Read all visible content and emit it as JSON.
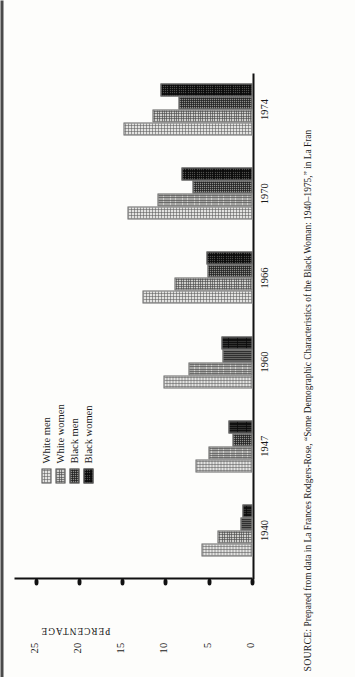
{
  "figure": {
    "orientation": "rotated-90-ccw-scan",
    "y_axis_title": "PERCENTAGE",
    "y_ticks": [
      "0",
      "5",
      "10",
      "15",
      "20",
      "25"
    ],
    "y_max": 27.5
  },
  "legend": {
    "items": [
      {
        "label": "White men",
        "pattern": "p0"
      },
      {
        "label": "White women",
        "pattern": "p1"
      },
      {
        "label": "Black men",
        "pattern": "p2"
      },
      {
        "label": "Black women",
        "pattern": "p3"
      }
    ]
  },
  "chart_data": {
    "type": "bar",
    "title": "",
    "xlabel": "",
    "ylabel": "PERCENTAGE",
    "ylim": [
      0,
      27.5
    ],
    "grid": false,
    "legend_position": "upper-left-inside",
    "categories": [
      "1940",
      "1947",
      "1960",
      "1966",
      "1970",
      "1974"
    ],
    "series": [
      {
        "name": "White men",
        "values": [
          5.9,
          6.6,
          10.3,
          12.7,
          14.4,
          14.9
        ]
      },
      {
        "name": "White women",
        "values": [
          4.0,
          5.1,
          7.4,
          9.0,
          11.0,
          11.5
        ]
      },
      {
        "name": "Black men",
        "values": [
          1.4,
          2.3,
          3.5,
          5.2,
          6.9,
          8.5
        ]
      },
      {
        "name": "Black women",
        "values": [
          1.2,
          2.8,
          3.6,
          5.3,
          8.2,
          10.6
        ]
      }
    ]
  },
  "source": {
    "prefix": "SOURCE:",
    "text": " Prepared from data in La Frances Rodgers-Rose, “Some Demographic Characteristics of the Black Woman: 1940–1975,” in La Fran"
  }
}
